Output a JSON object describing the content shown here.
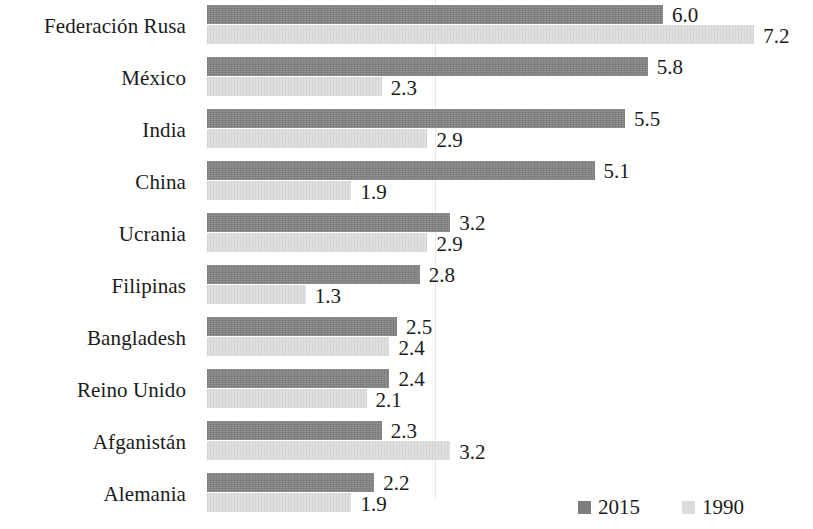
{
  "chart_data": {
    "type": "bar",
    "orientation": "horizontal",
    "title": "",
    "subtitle": "",
    "xlabel": "",
    "ylabel": "",
    "grid": true,
    "gridlines_x": [
      3.0
    ],
    "xlim": [
      0,
      8
    ],
    "legend_position": "bottom-right",
    "categories": [
      "Federación Rusa",
      "México",
      "India",
      "China",
      "Ucrania",
      "Filipinas",
      "Bangladesh",
      "Reino Unido",
      "Afganistán",
      "Alemania"
    ],
    "series": [
      {
        "name": "2015",
        "color": "#7d7d7d",
        "values": [
          6.0,
          5.8,
          5.5,
          5.1,
          3.2,
          2.8,
          2.5,
          2.4,
          2.3,
          2.2
        ],
        "labels": [
          "6.0",
          "5.8",
          "5.5",
          "5.1",
          "3.2",
          "2.8",
          "2.5",
          "2.4",
          "2.3",
          "2.2"
        ]
      },
      {
        "name": "1990",
        "color": "#dcdcdc",
        "values": [
          7.2,
          2.3,
          2.9,
          1.9,
          2.9,
          1.3,
          2.4,
          2.1,
          3.2,
          1.9
        ],
        "labels": [
          "7.2",
          "2.3",
          "2.9",
          "1.9",
          "2.9",
          "1.3",
          "2.4",
          "2.1",
          "3.2",
          "1.9"
        ]
      }
    ]
  },
  "legend": {
    "items": [
      {
        "label": "2015",
        "color": "#7d7d7d"
      },
      {
        "label": "1990",
        "color": "#dcdcdc"
      }
    ]
  }
}
